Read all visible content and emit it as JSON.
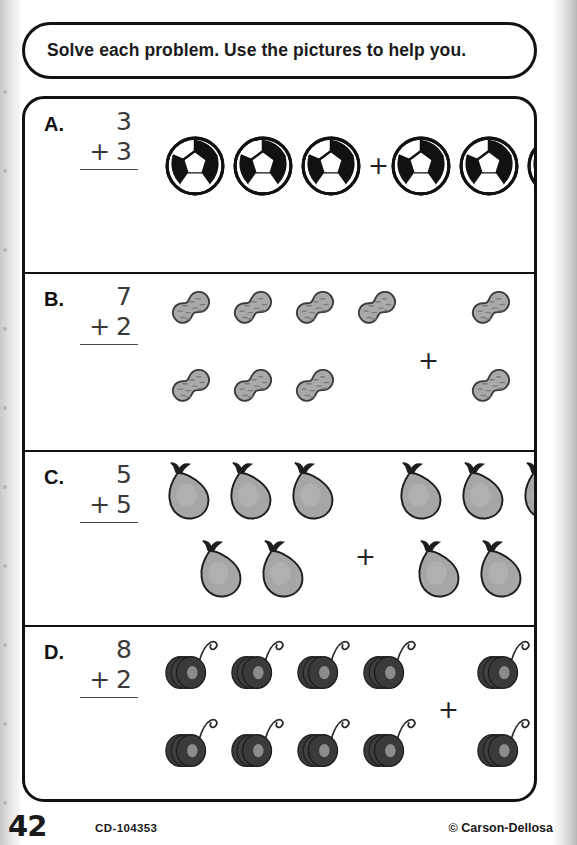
{
  "worksheet": {
    "instruction": "Solve each problem. Use the pictures to help you.",
    "plus_symbol": "+"
  },
  "problems": [
    {
      "letter": "A.",
      "addend_top": "3",
      "addend_bottom": "3",
      "operator": "+",
      "sum_blank": "",
      "picture_item": "soccer-ball",
      "left_count": 3,
      "right_count": 3,
      "left_rows": [
        3
      ],
      "right_rows": [
        3
      ]
    },
    {
      "letter": "B.",
      "addend_top": "7",
      "addend_bottom": "2",
      "operator": "+",
      "sum_blank": "",
      "picture_item": "peanut",
      "left_count": 7,
      "right_count": 2,
      "left_rows": [
        4,
        3
      ],
      "right_rows": [
        1,
        1
      ]
    },
    {
      "letter": "C.",
      "addend_top": "5",
      "addend_bottom": "5",
      "operator": "+",
      "sum_blank": "",
      "picture_item": "pear",
      "left_count": 5,
      "right_count": 5,
      "left_rows": [
        3,
        2
      ],
      "right_rows": [
        3,
        2
      ]
    },
    {
      "letter": "D.",
      "addend_top": "8",
      "addend_bottom": "2",
      "operator": "+",
      "sum_blank": "",
      "picture_item": "yo-yo",
      "left_count": 8,
      "right_count": 2,
      "left_rows": [
        4,
        4
      ],
      "right_rows": [
        1,
        1
      ]
    }
  ],
  "footer": {
    "page_number": "42",
    "product_code": "CD-104353",
    "copyright": "© Carson-Dellosa"
  },
  "colors": {
    "ink": "#111111",
    "number_ink": "#3a3a3a",
    "peanut_fill": "#a9a9a9",
    "pear_fill": "#a6a6a6",
    "yoyo_fill": "#3a3a3a",
    "yoyo_hub": "#8c8c8c",
    "page": "#ffffff",
    "scan_margin": "#d5d5d5"
  }
}
